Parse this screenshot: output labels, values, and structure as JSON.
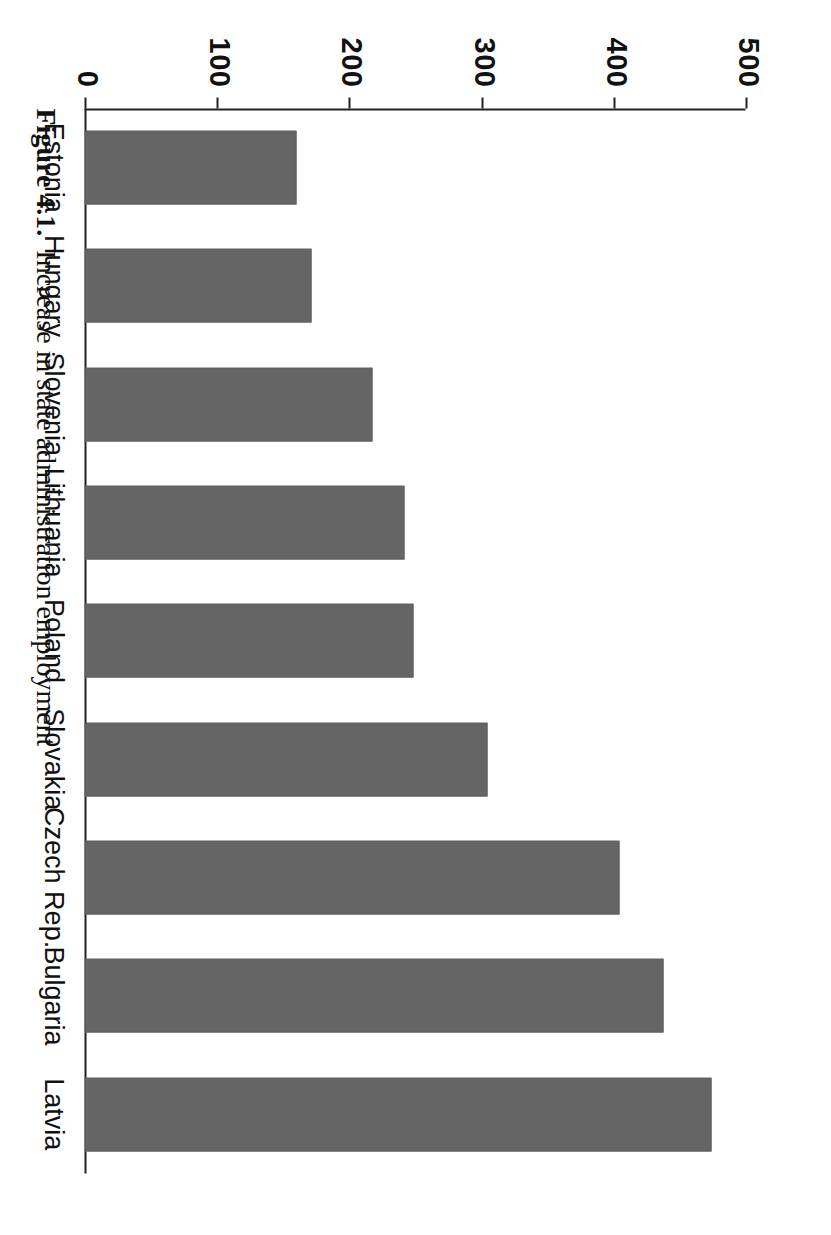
{
  "figure": {
    "caption_number": "Figure 4.1.",
    "caption_text": "Increase in state administration employment",
    "orientation": "page rotated 90 degrees clockwise in the scan",
    "bar_color": "#656565",
    "axis_color": "#222222"
  },
  "chart_data": {
    "type": "bar",
    "title": "Increase in state administration employment",
    "xlabel": "",
    "ylabel": "",
    "ylim": [
      0,
      500
    ],
    "yticks": [
      0,
      100,
      200,
      300,
      400,
      500
    ],
    "ytick_labels": [
      "0",
      "100",
      "200",
      "300",
      "400",
      "500"
    ],
    "grid": false,
    "legend": false,
    "categories": [
      "Estonia",
      "Hungary",
      "Slovenia",
      "Lithuania",
      "Poland",
      "Slovakia",
      "Czech Rep.",
      "Bulgaria",
      "Latvia"
    ],
    "values": [
      160,
      172,
      218,
      242,
      249,
      305,
      405,
      438,
      474
    ],
    "series": [
      {
        "name": "Increase in state administration employment",
        "values": [
          160,
          172,
          218,
          242,
          249,
          305,
          405,
          438,
          474
        ]
      }
    ]
  }
}
